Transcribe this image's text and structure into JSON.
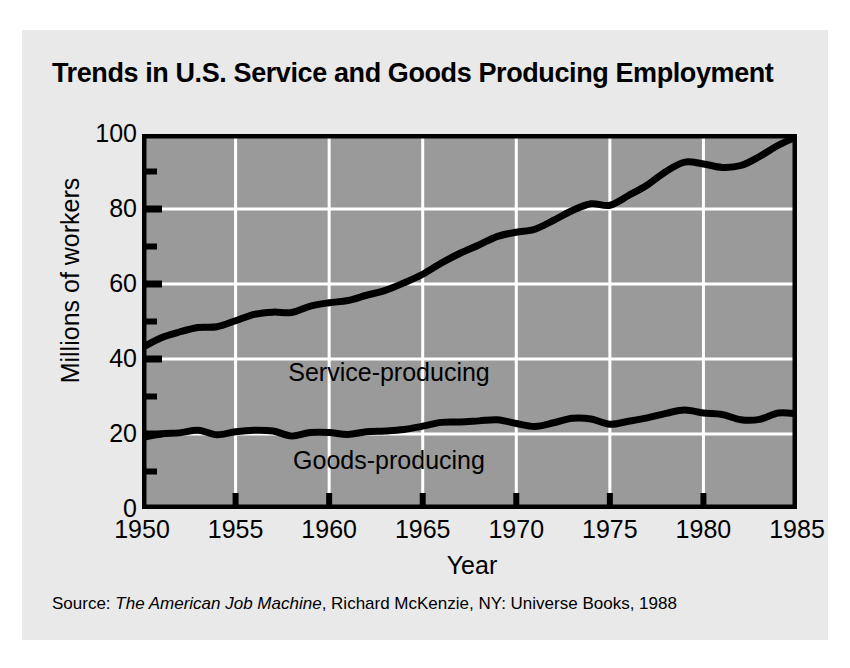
{
  "title": "Trends in U.S. Service and Goods Producing Employment",
  "source": {
    "prefix": "Source: ",
    "book": "The American Job Machine",
    "rest": ", Richard McKenzie, NY: Universe Books, 1988"
  },
  "colors": {
    "card_background": "#e9e9e9",
    "plot_background": "#9a9a9a",
    "gridline": "#ffffff",
    "axis": "#000000",
    "line": "#000000"
  },
  "chart_data": {
    "type": "line",
    "title": "Trends in U.S. Service and Goods Producing Employment",
    "xlabel": "Year",
    "ylabel": "Millions of workers",
    "xlim": [
      1950,
      1985
    ],
    "ylim": [
      0,
      100
    ],
    "xticks": [
      1950,
      1955,
      1960,
      1965,
      1970,
      1975,
      1980,
      1985
    ],
    "xtick_labels": [
      "1950",
      "1955",
      "1960",
      "1965",
      "1970",
      "1975",
      "1980",
      "1985"
    ],
    "yticks": [
      0,
      20,
      40,
      60,
      80,
      100
    ],
    "ytick_labels": [
      "0",
      "20",
      "40",
      "60",
      "80",
      "100"
    ],
    "yminor_ticks": [
      10,
      30,
      50,
      70,
      90
    ],
    "grid": true,
    "legend": "inline-labels",
    "x": [
      1950,
      1951,
      1952,
      1953,
      1954,
      1955,
      1956,
      1957,
      1958,
      1959,
      1960,
      1961,
      1962,
      1963,
      1964,
      1965,
      1966,
      1967,
      1968,
      1969,
      1970,
      1971,
      1972,
      1973,
      1974,
      1975,
      1976,
      1977,
      1978,
      1979,
      1980,
      1981,
      1982,
      1983,
      1984,
      1985
    ],
    "series": [
      {
        "name": "Service-producing",
        "label": "Service-producing",
        "label_x": 1963.2,
        "label_y": 36,
        "values": [
          43.0,
          45.6,
          47.2,
          48.4,
          48.6,
          50.2,
          51.9,
          52.5,
          52.4,
          54.1,
          55.0,
          55.6,
          57.0,
          58.3,
          60.3,
          62.6,
          65.6,
          68.2,
          70.4,
          72.7,
          73.8,
          74.6,
          77.0,
          79.6,
          81.4,
          81.0,
          83.6,
          86.4,
          90.0,
          92.5,
          92.0,
          91.1,
          91.6,
          94.0,
          97.0,
          99.3
        ]
      },
      {
        "name": "Goods-producing",
        "label": "Goods-producing",
        "label_x": 1963.2,
        "label_y": 12.5,
        "values": [
          19.0,
          20.0,
          20.3,
          21.0,
          19.8,
          20.6,
          21.0,
          20.8,
          19.5,
          20.4,
          20.4,
          19.9,
          20.6,
          20.8,
          21.2,
          22.1,
          23.1,
          23.2,
          23.5,
          23.8,
          22.8,
          22.0,
          23.0,
          24.2,
          24.0,
          22.6,
          23.4,
          24.3,
          25.5,
          26.4,
          25.6,
          25.2,
          23.8,
          23.9,
          25.6,
          25.4
        ]
      }
    ]
  }
}
